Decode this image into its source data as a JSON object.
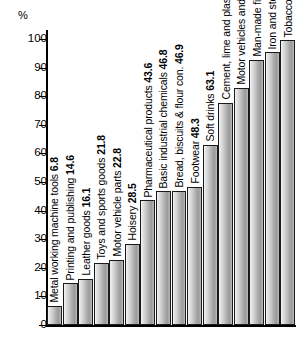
{
  "chart_data": {
    "type": "bar",
    "title": "",
    "xlabel": "",
    "ylabel": "%",
    "ylim": [
      0,
      100
    ],
    "grid": false,
    "legend": false,
    "tick_labels": [
      "0",
      "10",
      "20",
      "30",
      "40",
      "50",
      "60",
      "70",
      "80",
      "90",
      "100"
    ],
    "ticks": [
      0,
      10,
      20,
      30,
      40,
      50,
      60,
      70,
      80,
      90,
      100
    ],
    "categories": [
      "Metal working machine tools",
      "Printing and publishing",
      "Leather goods",
      "Toys and sports goods",
      "Motor vehicle parts",
      "Hoisery",
      "Pharmaceutical products",
      "Basic industrial chemicals",
      "Bread, biscuits & flour con.",
      "Footwear",
      "Soft drinks",
      "Cement, lime and plaster",
      "Motor vehicles and engines",
      "Man-made fibres",
      "Iron and steel industry",
      "Tobacco"
    ],
    "values": [
      6.8,
      14.6,
      16.1,
      21.8,
      22.8,
      28.5,
      43.6,
      46.8,
      46.9,
      48.3,
      63.1,
      77.8,
      83.0,
      92.7,
      95.4,
      99.5
    ],
    "bars": [
      {
        "label": "Metal working machine tools",
        "value": 6.8,
        "text": "Metal working machine tools 6.8"
      },
      {
        "label": "Printing and publishing",
        "value": 14.6,
        "text": "Printing and publishing 14.6"
      },
      {
        "label": "Leather goods",
        "value": 16.1,
        "text": "Leather goods 16.1"
      },
      {
        "label": "Toys and sports goods",
        "value": 21.8,
        "text": "Toys and sports goods 21.8"
      },
      {
        "label": "Motor vehicle parts",
        "value": 22.8,
        "text": "Motor vehicle parts 22.8"
      },
      {
        "label": "Hoisery",
        "value": 28.5,
        "text": "Hoisery 28.5"
      },
      {
        "label": "Pharmaceutical products",
        "value": 43.6,
        "text": "Pharmaceutical products 43.6"
      },
      {
        "label": "Basic industrial chemicals",
        "value": 46.8,
        "text": "Basic industrial chemicals 46.8"
      },
      {
        "label": "Bread, biscuits & flour con.",
        "value": 46.9,
        "text": "Bread, biscuits & flour con. 46.9"
      },
      {
        "label": "Footwear",
        "value": 48.3,
        "text": "Footwear 48.3"
      },
      {
        "label": "Soft drinks",
        "value": 63.1,
        "text": "Soft drinks 63.1"
      },
      {
        "label": "Cement, lime and plaster",
        "value": 77.8,
        "text": "Cement, lime and plaster 77.8"
      },
      {
        "label": "Motor vehicles and engines",
        "value": 83.0,
        "text": "Motor vehicles and engines 83.0"
      },
      {
        "label": "Man-made fibres",
        "value": 92.7,
        "text": "Man-made fibres 92.7"
      },
      {
        "label": "Iron and steel industry",
        "value": 95.4,
        "text": "Iron and steel industry 95.4"
      },
      {
        "label": "Tobacco",
        "value": 99.5,
        "text": "Tobacco 99.5"
      }
    ],
    "colors": {
      "bar_light": "#f4f4f4",
      "bar_dark": "#8f8f8f",
      "bar_outline": "#1a1a1a",
      "axis": "#000000",
      "text": "#000000",
      "background": "#ffffff"
    }
  }
}
